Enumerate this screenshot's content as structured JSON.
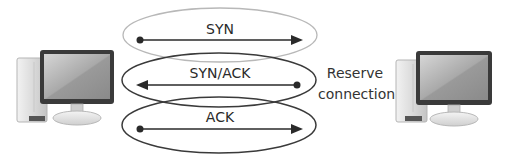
{
  "diagram": {
    "nodes": [
      {
        "id": "client",
        "icon": "desktop-computer-icon",
        "position": "left"
      },
      {
        "id": "server",
        "icon": "desktop-computer-icon",
        "position": "right"
      }
    ],
    "messages": [
      {
        "label": "SYN",
        "direction": "client-to-server",
        "ellipse_color": "#b8b8b8"
      },
      {
        "label": "SYN/ACK",
        "direction": "server-to-client",
        "ellipse_color": "#3a3a3a"
      },
      {
        "label": "ACK",
        "direction": "client-to-server",
        "ellipse_color": "#3a3a3a"
      }
    ],
    "annotation": {
      "line1": "Reserve",
      "line2": "connection"
    }
  }
}
